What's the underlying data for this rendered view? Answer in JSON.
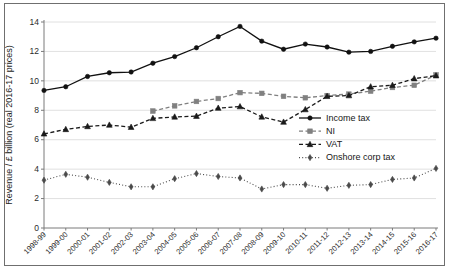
{
  "chart_data": {
    "type": "line",
    "title": "",
    "xlabel": "",
    "ylabel": "Revenue / £ billion (real 2016-17 prices)",
    "ylim": [
      0,
      14
    ],
    "ytick_step": 2,
    "yticks": [
      0,
      2,
      4,
      6,
      8,
      10,
      12,
      14
    ],
    "grid": true,
    "legend_position": "inside-right",
    "categories": [
      "1998-99",
      "1999-00",
      "2000-01",
      "2001-02",
      "2002-03",
      "2003-04",
      "2004-05",
      "2005-06",
      "2006-07",
      "2007-08",
      "2008-09",
      "2009-10",
      "2010-11",
      "2011-12",
      "2012-13",
      "2013-14",
      "2014-15",
      "2015-16",
      "2016-17"
    ],
    "series": [
      {
        "name": "Income tax",
        "color": "#111111",
        "marker": "circle",
        "dash": "solid",
        "values": [
          9.35,
          9.6,
          10.3,
          10.55,
          10.6,
          11.2,
          11.65,
          12.25,
          13.0,
          13.7,
          12.7,
          12.15,
          12.5,
          12.3,
          11.95,
          12.0,
          12.35,
          12.65,
          12.9
        ]
      },
      {
        "name": "NI",
        "color": "#808080",
        "marker": "square",
        "dash": "dashed",
        "values": [
          null,
          null,
          null,
          null,
          null,
          7.95,
          8.3,
          8.6,
          8.8,
          9.2,
          9.15,
          8.95,
          8.85,
          9.0,
          9.1,
          9.3,
          9.55,
          9.7,
          10.4
        ]
      },
      {
        "name": "VAT",
        "color": "#1a1a1a",
        "marker": "triangle",
        "dash": "dashed",
        "values": [
          6.4,
          6.7,
          6.9,
          7.0,
          6.85,
          7.45,
          7.55,
          7.6,
          8.15,
          8.25,
          7.55,
          7.2,
          8.05,
          8.95,
          9.0,
          9.6,
          9.7,
          10.15,
          10.35
        ]
      },
      {
        "name": "Onshore corp tax",
        "color": "#4a4a4a",
        "marker": "diamond",
        "dash": "dotted",
        "values": [
          3.25,
          3.65,
          3.45,
          3.1,
          2.8,
          2.8,
          3.35,
          3.7,
          3.5,
          3.4,
          2.65,
          2.95,
          2.95,
          2.7,
          2.9,
          2.95,
          3.3,
          3.4,
          4.05
        ]
      }
    ]
  }
}
